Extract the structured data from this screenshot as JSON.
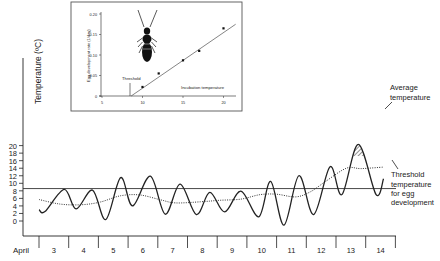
{
  "chart_data": [
    {
      "type": "line",
      "title": "",
      "ylabel": "Temperature (ºC)",
      "xlabel": "April",
      "ylim": [
        -2,
        21
      ],
      "yticks": [
        0,
        2,
        4,
        6,
        8,
        10,
        12,
        14,
        16,
        18,
        20
      ],
      "categories": [
        "3",
        "4",
        "5",
        "6",
        "7",
        "8",
        "9",
        "10",
        "11",
        "12",
        "13",
        "14"
      ],
      "x_axis_prefix": "April",
      "grid": false,
      "threshold": {
        "value": 8.6,
        "label": [
          "Threshold",
          "temperature",
          "for egg",
          "development"
        ]
      },
      "series": [
        {
          "name": "Daily temperature",
          "style": "solid",
          "note": "x = day position (3.0 = start of April 3)",
          "points": [
            [
              3.0,
              3.0
            ],
            [
              3.2,
              2.5
            ],
            [
              3.85,
              8.4
            ],
            [
              4.25,
              3.2
            ],
            [
              4.8,
              8.2
            ],
            [
              5.25,
              0.4
            ],
            [
              5.75,
              11.5
            ],
            [
              6.15,
              4.0
            ],
            [
              6.75,
              11.9
            ],
            [
              7.25,
              1.8
            ],
            [
              7.75,
              9.8
            ],
            [
              8.3,
              1.7
            ],
            [
              8.75,
              7.6
            ],
            [
              9.25,
              2.4
            ],
            [
              9.8,
              7.9
            ],
            [
              10.4,
              1.1
            ],
            [
              10.8,
              10.5
            ],
            [
              11.25,
              -1.1
            ],
            [
              11.75,
              12.0
            ],
            [
              12.25,
              1.7
            ],
            [
              12.8,
              14.4
            ],
            [
              13.2,
              7.0
            ],
            [
              13.75,
              20.3
            ],
            [
              14.35,
              7.0
            ],
            [
              14.6,
              11.2
            ]
          ]
        },
        {
          "name": "Average temperature",
          "style": "dotted",
          "points": [
            [
              3.0,
              5.7
            ],
            [
              3.7,
              4.5
            ],
            [
              4.4,
              4.3
            ],
            [
              5.05,
              5.0
            ],
            [
              5.75,
              6.7
            ],
            [
              6.4,
              6.9
            ],
            [
              7.1,
              5.6
            ],
            [
              7.6,
              4.8
            ],
            [
              8.45,
              5.1
            ],
            [
              9.1,
              5.5
            ],
            [
              9.8,
              5.8
            ],
            [
              10.45,
              7.0
            ],
            [
              11.0,
              7.1
            ],
            [
              11.65,
              6.4
            ],
            [
              12.15,
              7.8
            ],
            [
              12.65,
              10.5
            ],
            [
              13.35,
              14.0
            ],
            [
              13.85,
              13.9
            ],
            [
              14.6,
              14.3
            ]
          ]
        }
      ],
      "annotations": [
        {
          "text": [
            "Average",
            "temperature"
          ],
          "points_to": "Average temperature"
        },
        {
          "text": [
            "Threshold",
            "temperature",
            "for egg",
            "development"
          ],
          "points_to": "threshold"
        },
        {
          "shaded": "hatched area where daily temperature exceeds threshold"
        }
      ]
    },
    {
      "type": "scatter",
      "title": "",
      "inset": true,
      "xlabel": "Incubation temperature",
      "ylabel": "Egg development rate (1/day)",
      "xlim": [
        5,
        22
      ],
      "ylim": [
        0,
        0.2
      ],
      "xticks": [
        "5",
        "10",
        "15",
        "20"
      ],
      "yticks": [
        "0",
        "0.05",
        "0.10",
        "0.15",
        "0.20"
      ],
      "points": [
        [
          10,
          0.022
        ],
        [
          12,
          0.055
        ],
        [
          15,
          0.087
        ],
        [
          17,
          0.11
        ],
        [
          20,
          0.165
        ]
      ],
      "fit_line": {
        "from": [
          8.6,
          0
        ],
        "to": [
          21.5,
          0.175
        ]
      },
      "annotation": "Threshold",
      "image": "beetle-illustration"
    }
  ],
  "labels": {
    "main_y_axis": "Temperature (ºC)",
    "x_prefix": "April",
    "avg_line1": "Average",
    "avg_line2": "temperature",
    "thr_line1": "Threshold",
    "thr_line2": "temperature",
    "thr_line3": "for egg",
    "thr_line4": "development",
    "inset_ylabel": "Egg development rate (1/day)",
    "inset_xlabel": "Incubation temperature",
    "inset_threshold": "Threshold"
  },
  "colors": {
    "line": "#222222",
    "hatch": "#333333",
    "frame": "#555555",
    "background": "#ffffff"
  }
}
